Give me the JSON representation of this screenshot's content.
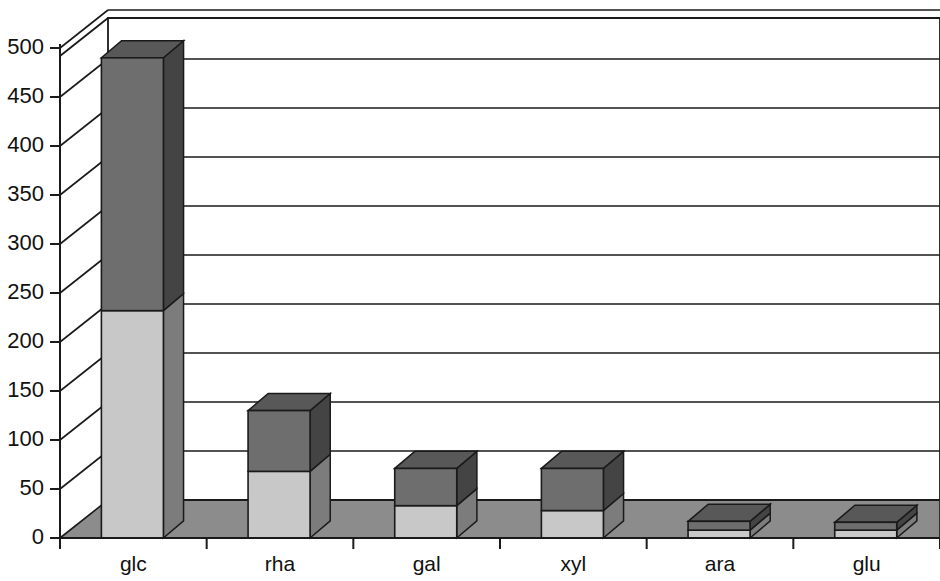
{
  "chart_data": {
    "type": "bar",
    "subtype": "stacked-3d-column",
    "title": "",
    "subtitle": "",
    "xlabel": "",
    "ylabel": "",
    "categories": [
      "glc",
      "rha",
      "gal",
      "xyl",
      "ara",
      "glu"
    ],
    "series": [
      {
        "name": "lower-segment",
        "color": "#c8c8c8",
        "values": [
          232,
          68,
          33,
          28,
          8,
          8
        ]
      },
      {
        "name": "upper-segment",
        "color": "#6e6e6e",
        "values": [
          258,
          62,
          38,
          43,
          9,
          8
        ]
      }
    ],
    "totals": [
      490,
      130,
      71,
      71,
      17,
      16
    ],
    "ylim": [
      0,
      500
    ],
    "ytick_step": 50,
    "ytick_labels": [
      "0",
      "50",
      "100",
      "150",
      "200",
      "250",
      "300",
      "350",
      "400",
      "450",
      "500"
    ],
    "ytick_values": [
      0,
      50,
      100,
      150,
      200,
      250,
      300,
      350,
      400,
      450,
      500
    ],
    "grid": true,
    "grid_axis": "y",
    "legend": false,
    "legend_position": "none",
    "style": {
      "background": "#ffffff",
      "floor_color": "#8c8c8c",
      "wall_color": "#ffffff",
      "line_color": "#1a1a1a",
      "bar_front_lower": "#c8c8c8",
      "bar_front_upper": "#6e6e6e",
      "bar_side_lower": "#8a8a8a",
      "bar_side_upper": "#4a4a4a",
      "bar_top_lower": "#b0b0b0",
      "bar_top_upper": "#565656"
    }
  },
  "axes": {
    "y_axis_name": "value-axis",
    "x_axis_name": "category-axis"
  }
}
